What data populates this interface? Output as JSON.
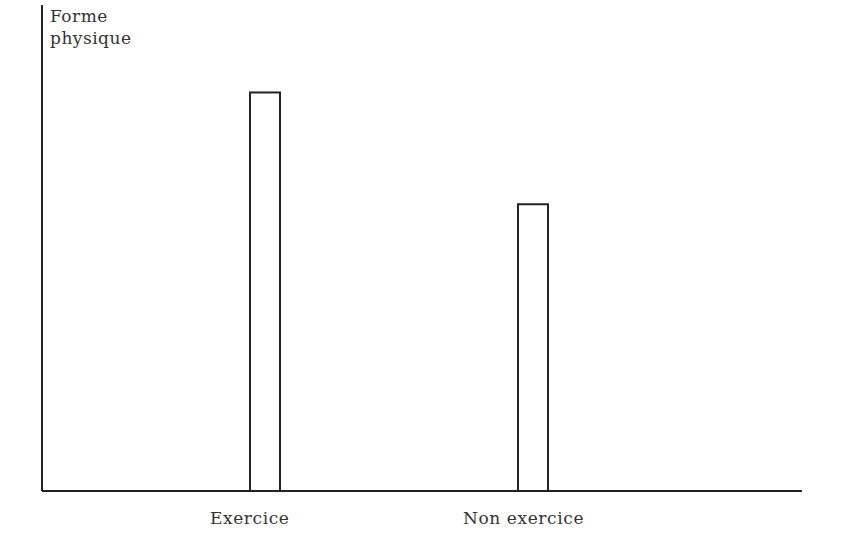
{
  "chart_data": {
    "type": "bar",
    "title": "",
    "xlabel": "",
    "ylabel": "Forme physique",
    "ylabel_lines": [
      "Forme",
      "physique"
    ],
    "categories": [
      "Exercice",
      "Non exercice"
    ],
    "values": [
      82,
      59
    ],
    "value_units": "relative (no numeric ticks shown)",
    "ylim": [
      0,
      100
    ],
    "grid": false,
    "legend": null,
    "bar_style": "outlined, white fill, black stroke"
  },
  "colors": {
    "axis": "#222222",
    "bar_stroke": "#222222",
    "bar_fill": "#ffffff",
    "text": "#333333"
  }
}
